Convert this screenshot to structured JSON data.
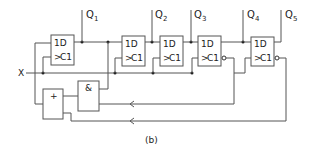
{
  "diagram": {
    "caption": "(b)",
    "input_label": "X",
    "flipflops": [
      {
        "id": "ff1",
        "d_label": "1D",
        "c_label": "C1",
        "output": "Q",
        "sub": "1",
        "inverted_output": false
      },
      {
        "id": "ff2",
        "d_label": "1D",
        "c_label": "C1",
        "output": "Q",
        "sub": "2",
        "inverted_output": false
      },
      {
        "id": "ff3",
        "d_label": "1D",
        "c_label": "C1",
        "output": "Q",
        "sub": "3",
        "inverted_output": false
      },
      {
        "id": "ff4",
        "d_label": "1D",
        "c_label": "C1",
        "output": "Q",
        "sub": "4",
        "inverted_output": true
      },
      {
        "id": "ff5",
        "d_label": "1D",
        "c_label": "C1",
        "output": "Q",
        "sub": "5",
        "inverted_output": true
      }
    ],
    "gates": {
      "or_label": "+",
      "and_label": "&"
    }
  }
}
